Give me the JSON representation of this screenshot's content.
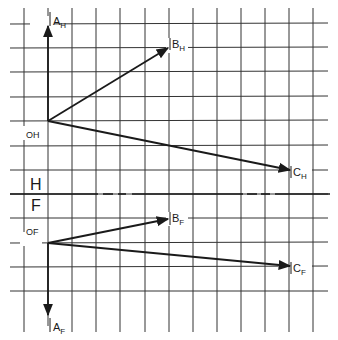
{
  "diagram": {
    "title": "",
    "views": {
      "top": {
        "name": "H",
        "origin_label": "OH",
        "points": [
          {
            "label": "A",
            "sub": "H"
          },
          {
            "label": "B",
            "sub": "H"
          },
          {
            "label": "C",
            "sub": "H"
          }
        ]
      },
      "front": {
        "name": "F",
        "origin_label": "OF",
        "points": [
          {
            "label": "A",
            "sub": "F"
          },
          {
            "label": "B",
            "sub": "F"
          },
          {
            "label": "C",
            "sub": "F"
          }
        ]
      }
    },
    "fold_line_labels": {
      "upper": "H",
      "lower": "F"
    },
    "colors": {
      "line": "#1a1a1a",
      "grid": "#333333",
      "background": "#ffffff"
    }
  }
}
